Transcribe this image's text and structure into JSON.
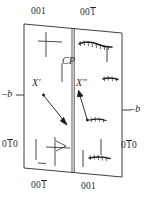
{
  "figure": {
    "type": "crystallographic-twin-schematic",
    "background_color": "#ffffff",
    "line_color": "#2b2b2b"
  },
  "labels": {
    "top_left": {
      "text": "001",
      "overbar": "none"
    },
    "top_right": {
      "text": "001",
      "overbar": "last-digit"
    },
    "bottom_left": {
      "text": "001",
      "overbar": "last-digit"
    },
    "bottom_right": {
      "text": "001",
      "overbar": "none"
    },
    "left_side_index": {
      "text": "010",
      "overbar": "middle-digit"
    },
    "right_side_index": {
      "text": "010",
      "overbar": "middle-digit"
    },
    "left_axis": {
      "text": "–b"
    },
    "right_axis": {
      "text": "–b"
    },
    "composition_plane": {
      "text": "CP"
    },
    "defect_left": {
      "text": "X′"
    },
    "defect_right": {
      "text": "X″"
    }
  },
  "annotations": [
    {
      "name": "arrow-to-defect-left",
      "from": [
        44,
        96
      ],
      "to": [
        67,
        124
      ]
    },
    {
      "name": "arrow-to-defect-right",
      "from": [
        86,
        117
      ],
      "to": [
        79,
        92
      ]
    }
  ],
  "features": {
    "left_panel": [
      {
        "name": "cross-mark-upper",
        "kind": "cross"
      },
      {
        "name": "vertical-line-upper",
        "kind": "line"
      },
      {
        "name": "vertical-line-lower",
        "kind": "line"
      },
      {
        "name": "flag-mark-lower",
        "kind": "cross-flag"
      },
      {
        "name": "short-dash-lower",
        "kind": "dash"
      }
    ],
    "right_panel": [
      {
        "name": "hatched-band-upper",
        "kind": "hatched-band"
      },
      {
        "name": "hatched-band-middle",
        "kind": "hatched-band"
      },
      {
        "name": "hatched-band-defect",
        "kind": "hatched-band"
      },
      {
        "name": "hatched-band-lower",
        "kind": "hatched-band"
      },
      {
        "name": "vertical-line-upper",
        "kind": "line"
      },
      {
        "name": "vertical-line-lower",
        "kind": "line"
      },
      {
        "name": "vertical-line-lower-left",
        "kind": "line"
      }
    ]
  }
}
